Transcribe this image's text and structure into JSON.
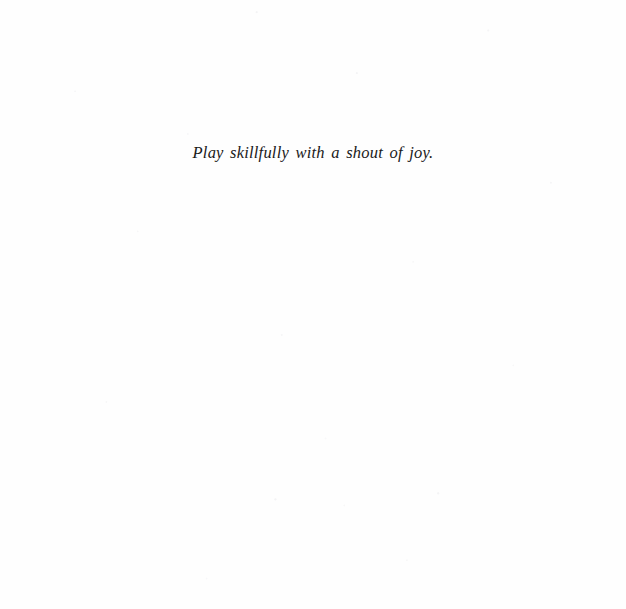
{
  "page": {
    "background_color": "#fefefe",
    "ink_color": "#1a1a1a"
  },
  "content": {
    "epigraph": "Play skillfully with a shout of joy."
  }
}
